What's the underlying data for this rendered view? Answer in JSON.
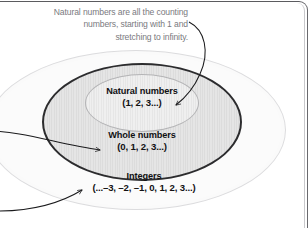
{
  "diagram": {
    "title_caption": "Natural numbers are all the counting numbers, starting with 1 and stretching to infinity.",
    "sets": [
      {
        "id": "natural",
        "name": "Natural numbers",
        "members": "(1, 2, 3...)",
        "level": 1
      },
      {
        "id": "whole",
        "name": "Whole numbers",
        "members": "(0, 1, 2, 3...)",
        "level": 2
      },
      {
        "id": "integers",
        "name": "Integers",
        "members": "(...–3, –2, –1, 0, 1, 2, 3...)",
        "level": 3
      }
    ],
    "annotations": [
      {
        "id": "caption-to-natural",
        "kind": "curved-arrow",
        "from": "caption",
        "to": "natural-numbers-ellipse"
      },
      {
        "id": "left-to-whole",
        "kind": "curved-arrow",
        "from": "offscreen-left",
        "to": "whole-numbers-ellipse"
      },
      {
        "id": "left-to-integers",
        "kind": "curved-arrow",
        "from": "offscreen-left-bottom",
        "to": "integers-ellipse"
      }
    ],
    "colors": {
      "caption_text": "#7a7a80",
      "label_text": "#111113",
      "integers_fill": "#fbfbfb",
      "integers_stroke": "#dcdcde",
      "whole_fill": "#e0e0e0",
      "whole_stroke": "#2c2c2e",
      "natural_fill": "#eaeaea",
      "natural_stroke": "#b4b4b6",
      "arrow_stroke": "#1a1a1c",
      "page_rule": "#5b5b5f"
    }
  }
}
